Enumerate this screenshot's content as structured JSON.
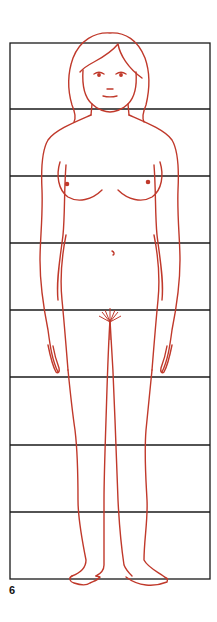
{
  "figure": {
    "number": "6",
    "frame": {
      "left": 10,
      "right": 210,
      "top": 43,
      "bottom": 579
    },
    "grid_lines_y": [
      43,
      109,
      176,
      243,
      310,
      377,
      445,
      512,
      579
    ],
    "units": 8,
    "colors": {
      "grid": "#1a1a1a",
      "figure": "#c0392b",
      "background": "#ffffff"
    }
  }
}
